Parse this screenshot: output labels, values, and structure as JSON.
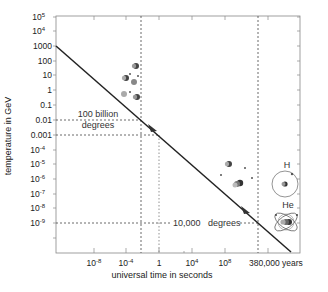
{
  "chart_data": {
    "type": "line",
    "title": "",
    "xlabel": "universal time in seconds",
    "ylabel": "temperature in GeV",
    "x_scale": "log",
    "y_scale": "log",
    "x_tick_labels": [
      {
        "label": "10",
        "exp": "-8",
        "px": 94
      },
      {
        "label": "10",
        "exp": "-4",
        "px": 126
      },
      {
        "label": "1",
        "exp": "",
        "px": 159
      },
      {
        "label": "10",
        "exp": "4",
        "px": 192
      },
      {
        "label": "10",
        "exp": "8",
        "px": 225
      },
      {
        "label": "380,000 years",
        "exp": "",
        "px": 268
      }
    ],
    "y_tick_labels": [
      {
        "label": "10",
        "exp": "5",
        "py": 17
      },
      {
        "label": "10",
        "exp": "4",
        "py": 31
      },
      {
        "label": "1000",
        "exp": "",
        "py": 46
      },
      {
        "label": "100",
        "exp": "",
        "py": 61
      },
      {
        "label": "10",
        "exp": "",
        "py": 75
      },
      {
        "label": "1",
        "exp": "",
        "py": 90
      },
      {
        "label": "0.1",
        "exp": "",
        "py": 105
      },
      {
        "label": "0.01",
        "exp": "",
        "py": 120
      },
      {
        "label": "0.001",
        "exp": "",
        "py": 135
      },
      {
        "label": "10",
        "exp": "-4",
        "py": 150
      },
      {
        "label": "10",
        "exp": "-5",
        "py": 164
      },
      {
        "label": "10",
        "exp": "-6",
        "py": 179
      },
      {
        "label": "10",
        "exp": "-7",
        "py": 194
      },
      {
        "label": "10",
        "exp": "-8",
        "py": 208
      },
      {
        "label": "10",
        "exp": "-9",
        "py": 223
      }
    ],
    "series": [
      {
        "name": "temperature vs time",
        "description": "Cooling of the universe: temperature falls from ~1000 GeV toward ~1e-11 GeV",
        "points_px": [
          [
            56,
            46
          ],
          [
            291,
            252
          ]
        ],
        "approx_values": [
          {
            "y_GeV": 1000
          },
          {
            "y_GeV": 1e-11
          }
        ]
      }
    ],
    "annotations": [
      {
        "text_line1": "100 billion",
        "text_line2": "degrees",
        "y_value": 0.01
      },
      {
        "text": "10,000",
        "text2": "degrees",
        "y_value": 1e-09
      },
      {
        "text": "H",
        "meaning": "hydrogen atom"
      },
      {
        "text": "He",
        "meaning": "helium atom"
      }
    ],
    "grid": false,
    "legend": "none"
  }
}
